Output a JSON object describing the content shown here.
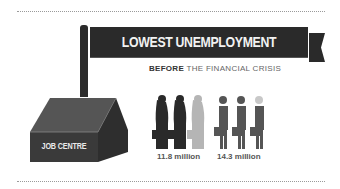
{
  "header": {
    "title": "LOWEST UNEMPLOYMENT",
    "subtitle_bold": "BEFORE",
    "subtitle_rest": " THE FINANCIAL CRISIS"
  },
  "building": {
    "label": "JOB CENTRE"
  },
  "figures": {
    "women": {
      "value": "11.8 million",
      "icon_count": 3,
      "icon": "woman-with-briefcase-icon"
    },
    "men": {
      "value": "14.3 million",
      "icon_count": 3,
      "icon": "man-with-briefcase-icon"
    }
  },
  "colors": {
    "dark": "#2a2a2a",
    "mid": "#555555",
    "light": "#b5b5b5",
    "text_muted": "#666666",
    "background": "#ffffff"
  }
}
